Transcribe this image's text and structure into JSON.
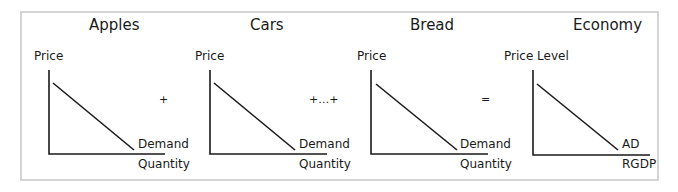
{
  "diagram": {
    "panels": [
      {
        "title": "Apples",
        "y_label": "Price",
        "x_label": "Quantity",
        "curve_label": "Demand"
      },
      {
        "title": "Cars",
        "y_label": "Price",
        "x_label": "Quantity",
        "curve_label": "Demand"
      },
      {
        "title": "Bread",
        "y_label": "Price",
        "x_label": "Quantity",
        "curve_label": "Demand"
      },
      {
        "title": "Economy",
        "y_label": "Price Level",
        "x_label": "RGDP",
        "curve_label": "AD"
      }
    ],
    "operators": [
      "+",
      "+…+",
      "="
    ],
    "colors": {
      "line": "#1a1a1a",
      "border": "#d4d4d4",
      "background": "#ffffff"
    }
  }
}
